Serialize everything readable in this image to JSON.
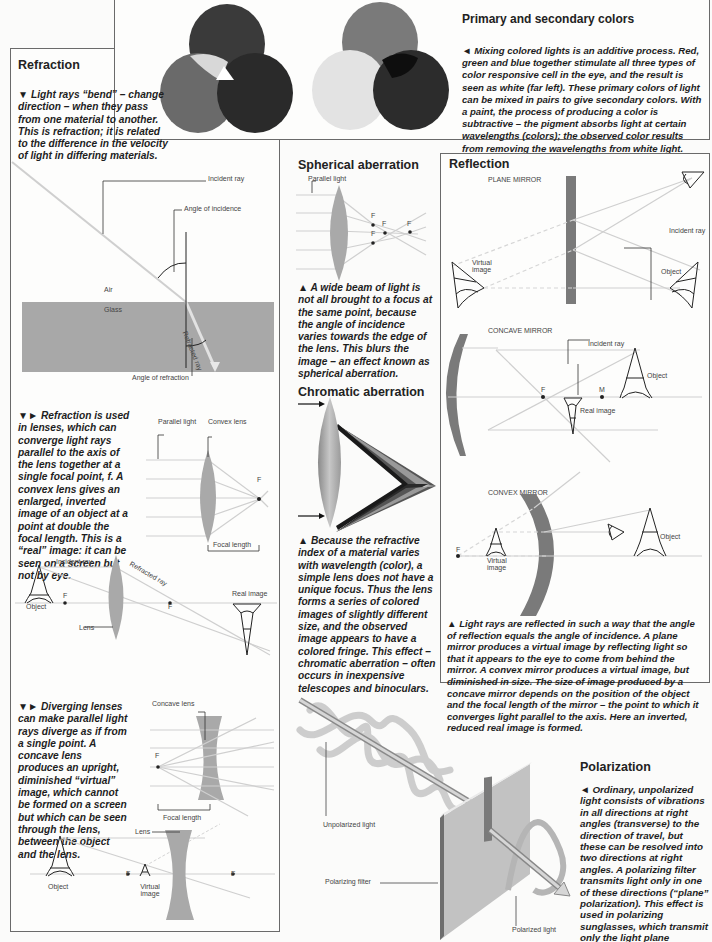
{
  "colors": {
    "border": "#6a6a6a",
    "glass": "#a8a8a8",
    "lens": "#a9a9a9",
    "mirror": "#7a7a7a",
    "ray": "#c6c6c6",
    "text": "#1e1e1e"
  },
  "primary": {
    "title": "Primary and secondary colors",
    "caption": "◄ Mixing colored lights is an additive process. Red, green and blue together stimulate all three types of color responsive cell in the eye, and the result is seen as white (far left). These primary colors of light can be mixed in pairs to give secondary colors. With a paint, the process of producing a color is subtractive – the pigment absorbs light at certain wavelengths (colors); the observed color results from removing the wavelengths from white light."
  },
  "refraction": {
    "title": "Refraction",
    "caption1": "▼ Light rays “bend” – change direction – when they pass from one material to another. This is refraction; it is related to the difference in the velocity of light in differing materials.",
    "labels": {
      "incident_ray": "Incident ray",
      "angle_incidence": "Angle of incidence",
      "air": "Air",
      "glass": "Glass",
      "refracted_ray": "Refracted ray",
      "angle_refraction": "Angle of refraction"
    },
    "caption2": "▼► Refraction is used in lenses, which can converge light rays parallel to the axis of the lens together at a single focal point, f. A convex lens gives an enlarged, inverted image of an object at a point at double the focal length. This is a “real” image: it can be seen on a screen but not by eye.",
    "convex_labels": {
      "parallel_light": "Parallel light",
      "convex_lens": "Convex lens",
      "f": "F",
      "focal_length": "Focal length",
      "incident_ray": "Incident ray",
      "refracted_ray": "Refracted ray",
      "real_image": "Real image",
      "object": "Object",
      "lens": "Lens"
    },
    "caption3": "▼► Diverging lenses can make parallel light rays diverge as if from a single point. A concave lens produces an upright, diminished “virtual” image, which cannot be formed on a screen but which can be seen through the lens, between the object and the lens.",
    "concave_labels": {
      "concave_lens": "Concave lens",
      "f": "F",
      "focal_length": "Focal length",
      "lens": "Lens",
      "object": "Object",
      "virtual_image": "Virtual image"
    }
  },
  "spherical": {
    "title": "Spherical aberration",
    "parallel_light": "Parallel light",
    "f": "F",
    "caption": "▲ A wide beam of light is not all brought to a focus at the same point, because the angle of incidence varies towards the edge of the lens. This blurs the image – an effect known as spherical aberration."
  },
  "chromatic": {
    "title": "Chromatic aberration",
    "caption": "▲ Because the refractive index of a material varies with wavelength (color), a simple lens does not have a unique focus. Thus the lens forms a series of colored images of slightly different size, and the observed image appears to have a colored fringe. This effect – chromatic aberration – often occurs in inexpensive telescopes and binoculars."
  },
  "reflection": {
    "title": "Reflection",
    "plane_mirror": "PLANE MIRROR",
    "concave_mirror": "CONCAVE MIRROR",
    "convex_mirror": "CONVEX MIRROR",
    "incident_ray": "Incident ray",
    "virtual_image": "Virtual image",
    "object": "Object",
    "real_image": "Real image",
    "f": "F",
    "m": "M",
    "caption": "▲ Light rays are reflected in such a way that the angle of reflection equals the angle of incidence. A plane mirror produces a virtual image by reflecting light so that it appears to the eye to come from behind the mirror. A convex mirror produces a virtual image, but diminished in size. The size of image produced by a concave mirror depends on the position of the object and the focal length of the mirror – the point to which it converges light parallel to the axis. Here an inverted, reduced real image is formed."
  },
  "polarization": {
    "title": "Polarization",
    "unpolarized_light": "Unpolarized light",
    "polarizing_filter": "Polarizing filter",
    "polarized_light": "Polarized light",
    "caption": "◄ Ordinary, unpolarized light consists of vibrations in all directions at right angles (transverse) to the direction of travel, but these can be resolved into two directions at right angles. A polarizing filter transmits light only in one of these directions (“plane” polarization). This effect is used in polarizing sunglasses, which transmit only the light plane polarized in one direction."
  }
}
